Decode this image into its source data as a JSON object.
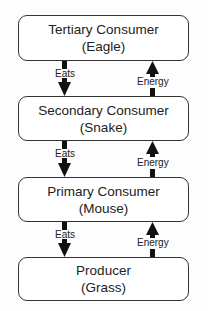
{
  "diagram": {
    "levels": [
      {
        "role": "Tertiary Consumer",
        "organism": "(Eagle)"
      },
      {
        "role": "Secondary Consumer",
        "organism": "(Snake)"
      },
      {
        "role": "Primary Consumer",
        "organism": "(Mouse)"
      },
      {
        "role": "Producer",
        "organism": "(Grass)"
      }
    ],
    "down_label": "Eats",
    "up_label": "Energy"
  }
}
